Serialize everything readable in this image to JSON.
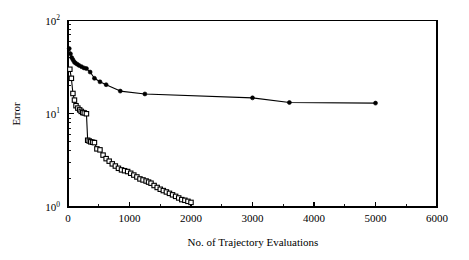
{
  "chart_data": {
    "type": "line",
    "title": "",
    "xlabel": "No. of Trajectory Evaluations",
    "ylabel": "Error",
    "xlim": [
      0,
      6000
    ],
    "ylim": [
      1,
      100
    ],
    "yscale": "log",
    "xscale": "linear",
    "grid": false,
    "legend": "none",
    "xticks": [
      0,
      1000,
      2000,
      3000,
      4000,
      5000,
      6000
    ],
    "xtick_labels": [
      "0",
      "1000",
      "2000",
      "3000",
      "4000",
      "5000",
      "6000"
    ],
    "yticks": [
      1,
      10,
      100
    ],
    "ytick_labels": [
      "10^0",
      "10^1",
      "10^2"
    ],
    "ytick_label_bases": [
      "10",
      "10",
      "10"
    ],
    "ytick_label_exponents": [
      "0",
      "1",
      "2"
    ],
    "series": [
      {
        "name": "filled-circle-series",
        "marker": "filled-circle",
        "color": "#000000",
        "x": [
          20,
          40,
          60,
          80,
          100,
          120,
          150,
          180,
          220,
          260,
          300,
          360,
          430,
          520,
          620,
          850,
          1250,
          3000,
          3600,
          5000
        ],
        "y": [
          50.0,
          44.0,
          40.0,
          38.0,
          36.0,
          35.0,
          34.0,
          33.0,
          32.0,
          31.0,
          30.5,
          28.0,
          24.0,
          22.0,
          20.5,
          17.5,
          16.3,
          14.8,
          13.2,
          13.0
        ]
      },
      {
        "name": "open-square-series",
        "marker": "open-square",
        "color": "#000000",
        "x": [
          30,
          55,
          80,
          105,
          130,
          160,
          190,
          215,
          240,
          265,
          300,
          320,
          345,
          370,
          400,
          430,
          470,
          520,
          570,
          620,
          670,
          720,
          770,
          820,
          870,
          920,
          970,
          1020,
          1070,
          1120,
          1170,
          1220,
          1270,
          1310,
          1350,
          1400,
          1450,
          1500,
          1550,
          1600,
          1650,
          1700,
          1750,
          1800,
          1850,
          1900,
          1950,
          2000
        ],
        "y": [
          30.0,
          24.0,
          16.5,
          14.0,
          12.2,
          11.5,
          11.0,
          10.6,
          10.3,
          10.2,
          10.0,
          5.2,
          5.1,
          5.0,
          4.95,
          4.9,
          4.2,
          4.1,
          3.6,
          3.3,
          3.1,
          2.9,
          2.75,
          2.6,
          2.5,
          2.45,
          2.4,
          2.3,
          2.2,
          2.1,
          2.0,
          1.95,
          1.9,
          1.85,
          1.8,
          1.7,
          1.62,
          1.55,
          1.5,
          1.45,
          1.4,
          1.35,
          1.3,
          1.25,
          1.2,
          1.18,
          1.15,
          1.12
        ]
      }
    ]
  },
  "axes": {
    "x_title": "No. of Trajectory Evaluations",
    "y_title": "Error"
  }
}
